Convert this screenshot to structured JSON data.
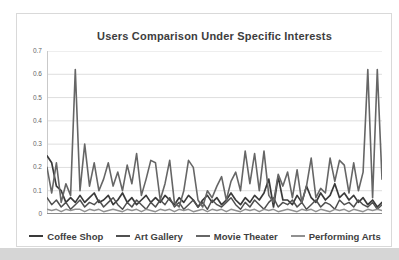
{
  "page": {
    "bottom_strip_color": "#d6d6d6",
    "frame_border_color": "#d9d9d9"
  },
  "chart_data": {
    "type": "line",
    "title": "Users Comparison Under Specific Interests",
    "xlabel": "",
    "ylabel": "",
    "x_count": 72,
    "x_axis_labels_visible": false,
    "ylim": [
      0,
      0.7
    ],
    "yticks": [
      0,
      0.1,
      0.2,
      0.3,
      0.4,
      0.5,
      0.6,
      0.7
    ],
    "ytick_labels": [
      "0",
      "0.1",
      "0.2",
      "0.3",
      "0.4",
      "0.5",
      "0.6",
      "0.7"
    ],
    "grid": true,
    "gridline_color": "#dedede",
    "axis_line_color": "#8c8c8c",
    "legend_position": "bottom",
    "series": [
      {
        "name": "Coffee Shop",
        "color": "#3a3a3a",
        "stroke_width": 1.7,
        "values": [
          0.25,
          0.22,
          0.12,
          0.1,
          0.05,
          0.07,
          0.05,
          0.08,
          0.05,
          0.07,
          0.09,
          0.05,
          0.06,
          0.08,
          0.04,
          0.06,
          0.09,
          0.05,
          0.07,
          0.04,
          0.06,
          0.08,
          0.05,
          0.07,
          0.05,
          0.08,
          0.06,
          0.04,
          0.07,
          0.05,
          0.08,
          0.06,
          0.03,
          0.06,
          0.08,
          0.05,
          0.07,
          0.04,
          0.06,
          0.09,
          0.06,
          0.04,
          0.07,
          0.05,
          0.08,
          0.06,
          0.09,
          0.15,
          0.03,
          0.16,
          0.06,
          0.06,
          0.04,
          0.08,
          0.05,
          0.12,
          0.07,
          0.05,
          0.09,
          0.06,
          0.08,
          0.13,
          0.07,
          0.09,
          0.06,
          0.08,
          0.05,
          0.07,
          0.04,
          0.06,
          0.03,
          0.05
        ]
      },
      {
        "name": "Art Gallery",
        "color": "#505050",
        "stroke_width": 1.5,
        "values": [
          0.07,
          0.04,
          0.06,
          0.03,
          0.05,
          0.02,
          0.04,
          0.06,
          0.03,
          0.05,
          0.04,
          0.06,
          0.03,
          0.05,
          0.07,
          0.04,
          0.02,
          0.05,
          0.03,
          0.06,
          0.04,
          0.02,
          0.05,
          0.03,
          0.06,
          0.04,
          0.07,
          0.03,
          0.05,
          0.02,
          0.04,
          0.06,
          0.03,
          0.05,
          0.02,
          0.06,
          0.04,
          0.03,
          0.05,
          0.07,
          0.04,
          0.02,
          0.05,
          0.03,
          0.06,
          0.04,
          0.02,
          0.05,
          0.07,
          0.03,
          0.05,
          0.04,
          0.06,
          0.03,
          0.05,
          0.02,
          0.04,
          0.06,
          0.03,
          0.05,
          0.04,
          0.02,
          0.06,
          0.04,
          0.05,
          0.03,
          0.06,
          0.04,
          0.03,
          0.05,
          0.02,
          0.04
        ]
      },
      {
        "name": "Movie Theater",
        "color": "#666666",
        "stroke_width": 1.6,
        "values": [
          0.2,
          0.09,
          0.22,
          0.05,
          0.13,
          0.08,
          0.62,
          0.1,
          0.3,
          0.12,
          0.22,
          0.1,
          0.15,
          0.22,
          0.12,
          0.18,
          0.1,
          0.21,
          0.13,
          0.26,
          0.08,
          0.15,
          0.23,
          0.22,
          0.06,
          0.13,
          0.23,
          0.05,
          0.03,
          0.1,
          0.23,
          0.2,
          0.06,
          0.03,
          0.1,
          0.07,
          0.12,
          0.16,
          0.06,
          0.14,
          0.18,
          0.1,
          0.27,
          0.13,
          0.26,
          0.1,
          0.27,
          0.08,
          0.05,
          0.17,
          0.12,
          0.18,
          0.07,
          0.19,
          0.05,
          0.12,
          0.24,
          0.07,
          0.11,
          0.09,
          0.24,
          0.14,
          0.23,
          0.21,
          0.09,
          0.22,
          0.1,
          0.18,
          0.62,
          0.07,
          0.62,
          0.15
        ]
      },
      {
        "name": "Performing Arts",
        "color": "#909090",
        "stroke_width": 1.4,
        "values": [
          0.02,
          0.015,
          0.02,
          0.01,
          0.02,
          0.015,
          0.02,
          0.02,
          0.01,
          0.02,
          0.015,
          0.02,
          0.01,
          0.015,
          0.02,
          0.015,
          0.01,
          0.02,
          0.015,
          0.02,
          0.01,
          0.02,
          0.015,
          0.01,
          0.02,
          0.015,
          0.02,
          0.01,
          0.02,
          0.015,
          0.02,
          0.01,
          0.015,
          0.02,
          0.01,
          0.02,
          0.015,
          0.02,
          0.01,
          0.02,
          0.015,
          0.01,
          0.02,
          0.015,
          0.02,
          0.01,
          0.02,
          0.015,
          0.02,
          0.01,
          0.015,
          0.02,
          0.015,
          0.01,
          0.02,
          0.015,
          0.02,
          0.01,
          0.02,
          0.015,
          0.01,
          0.02,
          0.015,
          0.02,
          0.01,
          0.02,
          0.015,
          0.01,
          0.02,
          0.015,
          0.02,
          0.015
        ]
      }
    ]
  }
}
